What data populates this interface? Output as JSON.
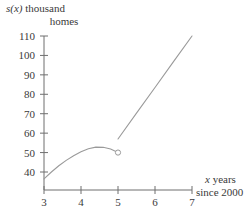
{
  "figure": {
    "background_color": "#ffffff",
    "line_color": "#9a9a9a",
    "axis_color": "#6f6f6f",
    "text_color": "#3a3a3a"
  },
  "axes": {
    "y_title_line1_var": "s(x)",
    "y_title_line1_rest": " thousand",
    "y_title_line2": "homes",
    "x_title_line1_var": "x",
    "x_title_line1_rest": " years",
    "x_title_line2": "since 2000"
  },
  "ticks": {
    "y": [
      {
        "label": "110",
        "value": 110
      },
      {
        "label": "100",
        "value": 100
      },
      {
        "label": "90",
        "value": 90
      },
      {
        "label": "80",
        "value": 80
      },
      {
        "label": "70",
        "value": 70
      },
      {
        "label": "60",
        "value": 60
      },
      {
        "label": "50",
        "value": 50
      },
      {
        "label": "40",
        "value": 40
      }
    ],
    "x": [
      {
        "label": "3",
        "value": 3
      },
      {
        "label": "4",
        "value": 4
      },
      {
        "label": "5",
        "value": 5
      },
      {
        "label": "6",
        "value": 6
      },
      {
        "label": "7",
        "value": 7
      }
    ]
  },
  "chart_data": {
    "type": "line",
    "title": "",
    "subtitle": "",
    "xlabel": "x years since 2000",
    "ylabel": "s(x) thousand homes",
    "xlim": [
      3,
      7
    ],
    "ylim": [
      36,
      112
    ],
    "grid": false,
    "legend": null,
    "xticks": [
      3,
      4,
      5,
      6,
      7
    ],
    "yticks": [
      40,
      50,
      60,
      70,
      80,
      90,
      100,
      110
    ],
    "annotations": [
      {
        "kind": "open-circle",
        "x": 5,
        "y": 50,
        "note": "open endpoint of curved branch at x = 5"
      }
    ],
    "series": [
      {
        "name": "curved branch",
        "style": "solid",
        "endpoint_start": "at axis",
        "endpoint_end": "open circle",
        "x": [
          3.0,
          3.2,
          3.4,
          3.6,
          3.8,
          4.0,
          4.2,
          4.4,
          4.6,
          4.8,
          5.0
        ],
        "y": [
          36.5,
          40.0,
          43.2,
          46.0,
          48.4,
          50.4,
          52.0,
          52.8,
          52.7,
          51.8,
          50.0
        ]
      },
      {
        "name": "linear branch",
        "style": "solid",
        "endpoint_start": "open at x = 5",
        "endpoint_end": "open at x = 7",
        "x": [
          5.0,
          5.5,
          6.0,
          6.5,
          7.0
        ],
        "y": [
          57.0,
          70.3,
          83.5,
          96.8,
          110.0
        ]
      }
    ]
  }
}
